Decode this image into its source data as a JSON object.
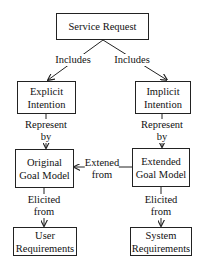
{
  "nodes": {
    "service_request": {
      "lines": [
        "Service Request"
      ]
    },
    "explicit_intention": {
      "line1": "Explicit",
      "line2": "Intention"
    },
    "implicit_intention": {
      "line1": "Implicit",
      "line2": "Intention"
    },
    "original_goal_model": {
      "line1": "Original",
      "line2": "Goal Model"
    },
    "extended_goal_model": {
      "line1": "Extended",
      "line2": "Goal Model"
    },
    "user_requirements": {
      "line1": "User",
      "line2": "Requirements"
    },
    "system_requirements": {
      "line1": "System",
      "line2": "Requirements"
    }
  },
  "edges": {
    "includes_left": {
      "label": "Includes"
    },
    "includes_right": {
      "label": "Includes"
    },
    "represent_left": {
      "line1": "Represent",
      "line2": "by"
    },
    "represent_right": {
      "line1": "Represent",
      "line2": "by"
    },
    "extended_from": {
      "line1": "Extened",
      "line2": "from"
    },
    "elicited_left": {
      "line1": "Elicited",
      "line2": "from"
    },
    "elicited_right": {
      "line1": "Elicited",
      "line2": "from"
    }
  }
}
